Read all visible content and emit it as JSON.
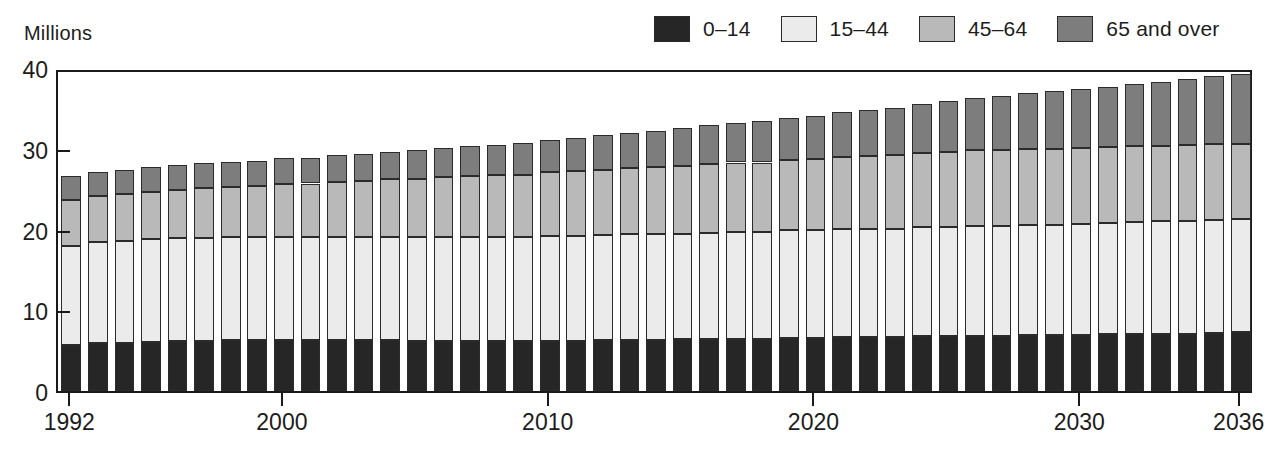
{
  "axis_title": "Millions",
  "legend": {
    "items": [
      {
        "label": "0–14",
        "color": "#262626"
      },
      {
        "label": "15–44",
        "color": "#ebebeb"
      },
      {
        "label": "45–64",
        "color": "#b9b9b9"
      },
      {
        "label": "65 and over",
        "color": "#7d7d7d"
      }
    ]
  },
  "chart_data": {
    "type": "bar",
    "title": "",
    "subtitle": "",
    "xlabel": "",
    "ylabel": "Millions",
    "stacked": true,
    "grid": false,
    "legend_position": "top-right",
    "ylim": [
      0,
      40
    ],
    "yticks": [
      0,
      10,
      20,
      30,
      40
    ],
    "xticks": [
      1992,
      2000,
      2010,
      2020,
      2030,
      2036
    ],
    "categories": [
      "1992",
      "1993",
      "1994",
      "1995",
      "1996",
      "1997",
      "1998",
      "1999",
      "2000",
      "2001",
      "2002",
      "2003",
      "2004",
      "2005",
      "2006",
      "2007",
      "2008",
      "2009",
      "2010",
      "2011",
      "2012",
      "2013",
      "2014",
      "2015",
      "2016",
      "2017",
      "2018",
      "2019",
      "2020",
      "2021",
      "2022",
      "2023",
      "2024",
      "2025",
      "2026",
      "2027",
      "2028",
      "2029",
      "2030",
      "2031",
      "2032",
      "2033",
      "2034",
      "2035",
      "2036"
    ],
    "series": [
      {
        "name": "0–14",
        "color": "#262626",
        "values": [
          5.7,
          5.9,
          6.0,
          6.1,
          6.2,
          6.2,
          6.3,
          6.3,
          6.3,
          6.3,
          6.3,
          6.3,
          6.3,
          6.2,
          6.2,
          6.2,
          6.2,
          6.2,
          6.2,
          6.2,
          6.3,
          6.3,
          6.3,
          6.4,
          6.4,
          6.5,
          6.5,
          6.6,
          6.6,
          6.7,
          6.7,
          6.7,
          6.8,
          6.8,
          6.8,
          6.8,
          6.9,
          6.9,
          6.9,
          7.0,
          7.0,
          7.1,
          7.1,
          7.2,
          7.3
        ]
      },
      {
        "name": "15–44",
        "color": "#ebebeb",
        "values": [
          12.3,
          12.6,
          12.6,
          12.7,
          12.7,
          12.8,
          12.8,
          12.8,
          12.8,
          12.8,
          12.8,
          12.8,
          12.8,
          12.9,
          12.9,
          12.9,
          12.9,
          12.9,
          13.0,
          13.0,
          13.0,
          13.1,
          13.1,
          13.1,
          13.2,
          13.2,
          13.2,
          13.3,
          13.3,
          13.4,
          13.4,
          13.4,
          13.5,
          13.5,
          13.6,
          13.6,
          13.7,
          13.7,
          13.8,
          13.8,
          13.9,
          13.9,
          14.0,
          14.0,
          14.0
        ]
      },
      {
        "name": "45–64",
        "color": "#b9b9b9",
        "values": [
          5.6,
          5.6,
          5.8,
          5.9,
          6.0,
          6.1,
          6.2,
          6.3,
          6.5,
          6.6,
          6.8,
          6.9,
          7.1,
          7.2,
          7.4,
          7.5,
          7.6,
          7.7,
          7.9,
          8.0,
          8.1,
          8.2,
          8.3,
          8.4,
          8.5,
          8.6,
          8.6,
          8.7,
          8.8,
          8.9,
          9.0,
          9.1,
          9.2,
          9.3,
          9.4,
          9.4,
          9.4,
          9.4,
          9.4,
          9.4,
          9.4,
          9.4,
          9.4,
          9.4,
          9.3
        ]
      },
      {
        "name": "65 and over",
        "color": "#7d7d7d",
        "values": [
          3.0,
          3.0,
          3.0,
          3.1,
          3.1,
          3.1,
          3.1,
          3.1,
          3.2,
          3.2,
          3.3,
          3.4,
          3.4,
          3.5,
          3.6,
          3.7,
          3.8,
          3.9,
          4.0,
          4.1,
          4.3,
          4.4,
          4.5,
          4.7,
          4.8,
          4.9,
          5.1,
          5.2,
          5.4,
          5.5,
          5.7,
          5.9,
          6.1,
          6.3,
          6.5,
          6.7,
          6.9,
          7.1,
          7.3,
          7.5,
          7.7,
          7.9,
          8.1,
          8.4,
          8.7
        ]
      }
    ],
    "totals": [
      26.6,
      27.1,
      27.4,
      27.8,
      28.0,
      28.2,
      28.4,
      28.5,
      28.8,
      28.9,
      29.2,
      29.4,
      29.6,
      29.8,
      30.1,
      30.3,
      30.5,
      30.7,
      31.1,
      31.3,
      31.7,
      32.0,
      32.2,
      32.6,
      32.9,
      33.2,
      33.4,
      33.8,
      34.1,
      34.5,
      34.8,
      35.1,
      35.6,
      35.9,
      36.3,
      36.5,
      36.9,
      37.1,
      37.4,
      37.7,
      38.0,
      38.3,
      38.6,
      39.0,
      39.3
    ]
  }
}
